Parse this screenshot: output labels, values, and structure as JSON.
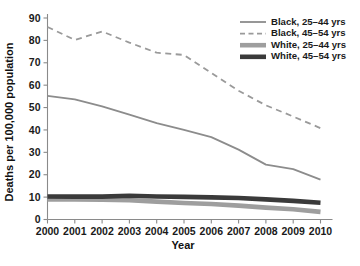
{
  "chart_data": {
    "type": "line",
    "title": "",
    "xlabel": "Year",
    "ylabel": "Deaths per 100,000 population",
    "x": [
      2000,
      2001,
      2002,
      2003,
      2004,
      2005,
      2006,
      2007,
      2008,
      2009,
      2010
    ],
    "categories": [
      "2000",
      "2001",
      "2002",
      "2003",
      "2004",
      "2005",
      "2006",
      "2007",
      "2008",
      "2009",
      "2010"
    ],
    "xlim": [
      2000,
      2010
    ],
    "ylim": [
      0,
      90
    ],
    "yticks": [
      0,
      10,
      20,
      30,
      40,
      50,
      60,
      70,
      80,
      90
    ],
    "ytick_labels": [
      "0",
      "10",
      "20",
      "30",
      "40",
      "50",
      "60",
      "70",
      "80",
      "90"
    ],
    "grid": false,
    "legend_position": "top-right",
    "series": [
      {
        "name": "Black, 25–44 yrs",
        "values": [
          55.2,
          53.7,
          50.5,
          46.8,
          43.0,
          40.0,
          36.8,
          31.2,
          24.5,
          22.5,
          17.8
        ],
        "style": "solid",
        "color": "#8c8c8c",
        "width": 1.8
      },
      {
        "name": "Black, 45–54 yrs",
        "values": [
          86.0,
          80.2,
          84.0,
          79.0,
          74.5,
          73.5,
          65.5,
          57.5,
          51.0,
          46.0,
          40.8
        ],
        "style": "dashed",
        "color": "#9a9a9a",
        "width": 1.8
      },
      {
        "name": "White, 25–44 yrs",
        "values": [
          9.0,
          8.9,
          8.8,
          8.6,
          8.0,
          7.4,
          6.9,
          6.2,
          5.3,
          4.6,
          3.4
        ],
        "style": "solid",
        "color": "#9e9e9e",
        "width": 4.6
      },
      {
        "name": "White, 45–54 yrs",
        "values": [
          10.3,
          10.2,
          10.2,
          10.6,
          10.3,
          10.1,
          9.9,
          9.6,
          9.0,
          8.3,
          7.5
        ],
        "style": "solid",
        "color": "#3a3a3a",
        "width": 4.6
      }
    ],
    "legend_entries": [
      "Black, 25–44 yrs",
      "Black, 45–54 yrs",
      "White, 25–44 yrs",
      "White, 45–54 yrs"
    ]
  },
  "colors": {
    "background": "#ffffff",
    "axis": "#8a8a8a",
    "text": "#1a1a1a",
    "black_25_44": "#8c8c8c",
    "black_45_54": "#9a9a9a",
    "white_25_44": "#9e9e9e",
    "white_45_54": "#3a3a3a"
  }
}
